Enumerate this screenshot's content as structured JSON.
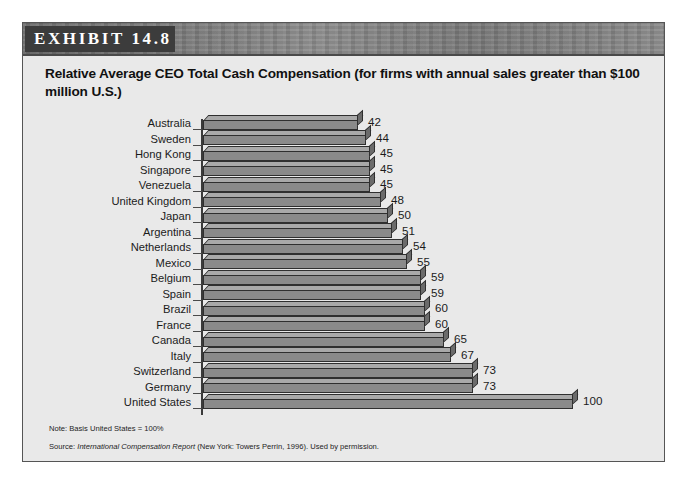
{
  "exhibit": {
    "tag": "EXHIBIT 14.8",
    "title": "Relative Average CEO Total Cash Compensation (for firms with annual sales greater than $100 million U.S.)",
    "notes": {
      "basis_label": "Note: Basis United States = 100%",
      "source_prefix": "Source: ",
      "source_italic": "International Compensation Report",
      "source_suffix": " (New York: Towers Perrin, 1996). Used by permission."
    },
    "colors": {
      "panel_background": "#e9e9e9",
      "header_band": "#808080",
      "tag_background": "#3c3c3c",
      "bar_front": "#8a8a8a",
      "bar_top": "#a9a9a9",
      "bar_cap": "#6b6b6b",
      "bar_outline": "#2f2f2f",
      "text": "#1b1b1b"
    }
  },
  "chart_data": {
    "type": "bar",
    "orientation": "horizontal",
    "title": "Relative Average CEO Total Cash Compensation (for firms with annual sales greater than $100 million U.S.)",
    "xlabel": "",
    "ylabel": "",
    "xlim": [
      0,
      100
    ],
    "grid": false,
    "legend": "none",
    "value_labels": true,
    "basis_note": "Basis United States = 100%",
    "categories": [
      "Australia",
      "Sweden",
      "Hong Kong",
      "Singapore",
      "Venezuela",
      "United Kingdom",
      "Japan",
      "Argentina",
      "Netherlands",
      "Mexico",
      "Belgium",
      "Spain",
      "Brazil",
      "France",
      "Canada",
      "Italy",
      "Switzerland",
      "Germany",
      "United States"
    ],
    "values": [
      42,
      44,
      45,
      45,
      45,
      48,
      50,
      51,
      54,
      55,
      59,
      59,
      60,
      60,
      65,
      67,
      73,
      73,
      100
    ]
  }
}
